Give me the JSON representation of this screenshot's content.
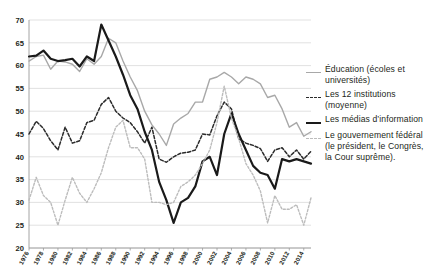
{
  "chart_data": {
    "type": "line",
    "title": "",
    "xlabel": "",
    "ylabel": "",
    "xlim": [
      1976,
      2015
    ],
    "ylim": [
      20,
      70
    ],
    "yticks": [
      20,
      25,
      30,
      35,
      40,
      45,
      50,
      55,
      60,
      65,
      70
    ],
    "xticks": [
      1976,
      1978,
      1980,
      1982,
      1984,
      1986,
      1988,
      1990,
      1992,
      1994,
      1996,
      1998,
      2000,
      2002,
      2004,
      2006,
      2008,
      2010,
      2012,
      2014
    ],
    "grid": true,
    "legend_position": "right",
    "x": [
      1976,
      1977,
      1978,
      1979,
      1980,
      1981,
      1982,
      1983,
      1984,
      1985,
      1986,
      1987,
      1988,
      1989,
      1990,
      1991,
      1992,
      1993,
      1994,
      1995,
      1996,
      1997,
      1998,
      1999,
      2000,
      2001,
      2002,
      2003,
      2004,
      2005,
      2006,
      2007,
      2008,
      2009,
      2010,
      2011,
      2012,
      2013,
      2014,
      2015
    ],
    "series": [
      {
        "name": "Éducation (écoles et universités)",
        "color": "#a8a8a8",
        "style": "solid",
        "width": 1.4,
        "values": [
          61.0,
          62.0,
          62.3,
          59.2,
          61.0,
          60.8,
          60.3,
          58.7,
          61.5,
          60.3,
          62.0,
          66.0,
          65.0,
          61.0,
          57.5,
          54.5,
          50.0,
          47.0,
          45.0,
          42.5,
          47.2,
          48.5,
          49.5,
          52.0,
          52.0,
          57.0,
          57.5,
          58.5,
          57.5,
          56.0,
          57.5,
          57.0,
          56.0,
          53.0,
          53.5,
          50.5,
          46.5,
          47.5,
          44.5,
          45.5
        ]
      },
      {
        "name": "Les 12 institutions (moyenne)",
        "color": "#2b2b2b",
        "style": "dashed",
        "width": 1.5,
        "values": [
          45.0,
          47.8,
          46.2,
          43.5,
          41.5,
          46.5,
          43.0,
          43.5,
          47.5,
          48.0,
          51.5,
          53.0,
          50.0,
          48.5,
          47.5,
          45.5,
          43.0,
          46.5,
          39.5,
          38.8,
          40.0,
          40.8,
          41.0,
          41.5,
          45.0,
          44.8,
          49.0,
          52.0,
          50.5,
          44.0,
          43.0,
          42.5,
          41.8,
          39.0,
          41.5,
          42.0,
          40.0,
          41.5,
          39.5,
          41.2
        ]
      },
      {
        "name": "Les médias d’information",
        "color": "#1a1a1a",
        "style": "solid",
        "width": 2.2,
        "values": [
          62.0,
          62.2,
          63.3,
          61.5,
          61.0,
          61.2,
          61.5,
          59.8,
          62.0,
          61.0,
          69.0,
          65.5,
          62.0,
          58.0,
          53.5,
          50.5,
          45.5,
          41.5,
          34.5,
          30.5,
          25.5,
          30.0,
          31.0,
          33.5,
          39.0,
          40.0,
          36.0,
          45.0,
          49.5,
          45.0,
          41.5,
          38.0,
          36.5,
          36.0,
          33.0,
          39.5,
          39.0,
          39.5,
          39.0,
          38.5
        ]
      },
      {
        "name": "Le gouvernement fédéral (le président, le Congrès, la Cour suprême).",
        "color": "#bcbcbc",
        "style": "dotted",
        "width": 1.4,
        "values": [
          30.5,
          35.5,
          31.5,
          30.0,
          25.0,
          30.5,
          35.5,
          32.0,
          30.0,
          33.0,
          36.5,
          42.0,
          46.5,
          48.0,
          42.0,
          42.0,
          39.5,
          30.0,
          30.0,
          29.5,
          30.0,
          33.5,
          34.5,
          36.0,
          38.5,
          41.5,
          47.5,
          55.5,
          48.5,
          44.0,
          38.5,
          36.0,
          32.5,
          25.5,
          31.5,
          28.5,
          28.5,
          29.5,
          25.0,
          31.0
        ]
      }
    ]
  },
  "legend": {
    "items": [
      {
        "line1": "Éducation (écoles et",
        "line2": "universités)",
        "marker": "gray-solid"
      },
      {
        "line1": "Les 12 institutions",
        "line2": "(moyenne)",
        "marker": "black-dash"
      },
      {
        "line1": "Les médias d’information",
        "line2": "",
        "marker": "black-solid"
      },
      {
        "line1": "Le gouvernement fédéral",
        "line2": "(le président, le Congrès,",
        "line3": "la Cour suprême).",
        "marker": "gray-dot"
      }
    ]
  }
}
